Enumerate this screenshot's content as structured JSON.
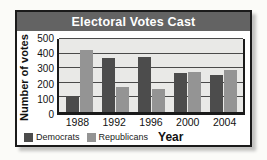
{
  "window": {
    "background": "#fbfbf8"
  },
  "card": {
    "background": "#ffffff",
    "border_color": "#1b1b1b",
    "shadow_color": "#c2c2c0"
  },
  "title_bar": {
    "background": "#636363",
    "text_color": "#ffffff"
  },
  "chart_data": {
    "type": "bar",
    "title": "Electoral Votes Cast",
    "categories": [
      "1988",
      "1992",
      "1996",
      "2000",
      "2004"
    ],
    "series": [
      {
        "name": "Democrats",
        "color": "#4c4c4c",
        "values": [
          111,
          370,
          379,
          266,
          251
        ]
      },
      {
        "name": "Republicans",
        "color": "#949494",
        "values": [
          426,
          168,
          159,
          271,
          286
        ]
      }
    ],
    "xlabel": "Year",
    "ylabel": "Number of votes",
    "ylim": [
      0,
      500
    ],
    "y_ticks": [
      0,
      100,
      200,
      300,
      400,
      500
    ],
    "grid": true,
    "gridline_color": "#4a4a4a",
    "plot_background": "#e9e9e7",
    "axis_color": "#1a1a1a",
    "legend_position": "bottom-left"
  }
}
